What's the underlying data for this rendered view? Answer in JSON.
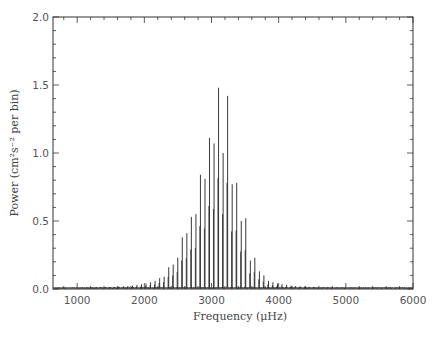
{
  "chart_data": {
    "type": "line",
    "title": "",
    "xlabel": "Frequency (μHz)",
    "ylabel": "Power (cm²s⁻² per bin)",
    "xlim": [
      640,
      6000
    ],
    "ylim": [
      0.0,
      2.0
    ],
    "grid": false,
    "legend": "none",
    "x_ticks": [
      1000,
      2000,
      3000,
      4000,
      5000,
      6000
    ],
    "x_tick_labels": [
      "1000",
      "2000",
      "3000",
      "4000",
      "5000",
      "6000"
    ],
    "x_minor_step": 200,
    "y_ticks": [
      0.0,
      0.5,
      1.0,
      1.5,
      2.0
    ],
    "y_tick_labels": [
      "0.0",
      "0.5",
      "1.0",
      "1.5",
      "2.0"
    ],
    "y_minor_step": 0.1,
    "series": [
      {
        "name": "power spectrum",
        "peaks": [
          {
            "f": 1080,
            "p": 0.01
          },
          {
            "f": 1148,
            "p": 0.012
          },
          {
            "f": 1215,
            "p": 0.012
          },
          {
            "f": 1283,
            "p": 0.013
          },
          {
            "f": 1350,
            "p": 0.014
          },
          {
            "f": 1418,
            "p": 0.013
          },
          {
            "f": 1485,
            "p": 0.015
          },
          {
            "f": 1553,
            "p": 0.016
          },
          {
            "f": 1620,
            "p": 0.018
          },
          {
            "f": 1688,
            "p": 0.02
          },
          {
            "f": 1755,
            "p": 0.022
          },
          {
            "f": 1823,
            "p": 0.025
          },
          {
            "f": 1890,
            "p": 0.03
          },
          {
            "f": 1958,
            "p": 0.035
          },
          {
            "f": 2025,
            "p": 0.04
          },
          {
            "f": 2093,
            "p": 0.05
          },
          {
            "f": 2160,
            "p": 0.06
          },
          {
            "f": 2228,
            "p": 0.08
          },
          {
            "f": 2295,
            "p": 0.09
          },
          {
            "f": 2363,
            "p": 0.16
          },
          {
            "f": 2430,
            "p": 0.18
          },
          {
            "f": 2498,
            "p": 0.23
          },
          {
            "f": 2565,
            "p": 0.38
          },
          {
            "f": 2633,
            "p": 0.41
          },
          {
            "f": 2700,
            "p": 0.53
          },
          {
            "f": 2768,
            "p": 0.55
          },
          {
            "f": 2835,
            "p": 0.84
          },
          {
            "f": 2903,
            "p": 0.81
          },
          {
            "f": 2970,
            "p": 1.11
          },
          {
            "f": 3038,
            "p": 1.07
          },
          {
            "f": 3105,
            "p": 1.48
          },
          {
            "f": 3173,
            "p": 1.0
          },
          {
            "f": 3240,
            "p": 1.42
          },
          {
            "f": 3308,
            "p": 0.77
          },
          {
            "f": 3375,
            "p": 0.78
          },
          {
            "f": 3443,
            "p": 0.5
          },
          {
            "f": 3510,
            "p": 0.52
          },
          {
            "f": 3578,
            "p": 0.21
          },
          {
            "f": 3645,
            "p": 0.23
          },
          {
            "f": 3713,
            "p": 0.13
          },
          {
            "f": 3780,
            "p": 0.1
          },
          {
            "f": 3848,
            "p": 0.06
          },
          {
            "f": 3915,
            "p": 0.05
          },
          {
            "f": 3983,
            "p": 0.04
          },
          {
            "f": 4050,
            "p": 0.035
          },
          {
            "f": 4118,
            "p": 0.03
          },
          {
            "f": 4185,
            "p": 0.025
          },
          {
            "f": 4253,
            "p": 0.022
          },
          {
            "f": 4320,
            "p": 0.02
          },
          {
            "f": 4388,
            "p": 0.018
          },
          {
            "f": 4455,
            "p": 0.016
          },
          {
            "f": 4523,
            "p": 0.015
          },
          {
            "f": 4590,
            "p": 0.014
          },
          {
            "f": 4658,
            "p": 0.013
          },
          {
            "f": 4725,
            "p": 0.012
          },
          {
            "f": 4793,
            "p": 0.012
          },
          {
            "f": 4860,
            "p": 0.011
          },
          {
            "f": 4928,
            "p": 0.011
          },
          {
            "f": 4995,
            "p": 0.01
          },
          {
            "f": 5063,
            "p": 0.01
          },
          {
            "f": 5130,
            "p": 0.01
          },
          {
            "f": 5198,
            "p": 0.01
          },
          {
            "f": 5265,
            "p": 0.01
          },
          {
            "f": 5333,
            "p": 0.01
          },
          {
            "f": 5400,
            "p": 0.01
          },
          {
            "f": 5468,
            "p": 0.01
          },
          {
            "f": 5535,
            "p": 0.01
          },
          {
            "f": 5603,
            "p": 0.01
          },
          {
            "f": 5670,
            "p": 0.01
          },
          {
            "f": 5738,
            "p": 0.01
          },
          {
            "f": 5805,
            "p": 0.01
          },
          {
            "f": 5873,
            "p": 0.01
          },
          {
            "f": 5940,
            "p": 0.01
          }
        ],
        "secondary_peak_offset_uHz": -9,
        "secondary_peak_ratio": 0.55,
        "baseline_power": 0.005,
        "color": "#222222"
      }
    ]
  }
}
